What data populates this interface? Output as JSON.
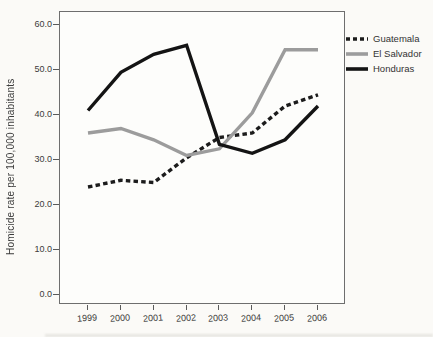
{
  "chart_data": {
    "type": "line",
    "x": [
      1999,
      2000,
      2001,
      2002,
      2003,
      2004,
      2005,
      2006
    ],
    "xtick_labels": [
      "1999",
      "2000",
      "2001",
      "2002",
      "2003",
      "2004",
      "2005",
      "2006"
    ],
    "series": [
      {
        "name": "Guatemala",
        "values": [
          24,
          25.5,
          25,
          30.5,
          35,
          36,
          42,
          44.5
        ],
        "color": "#1c1c1c",
        "line_style": "dashed"
      },
      {
        "name": "El Salvador",
        "values": [
          36,
          37,
          34.5,
          31,
          32.5,
          40.5,
          54.5,
          54.5
        ],
        "color": "#9c9c9c",
        "line_style": "solid"
      },
      {
        "name": "Honduras",
        "values": [
          41,
          49.5,
          53.5,
          55.5,
          33.5,
          31.5,
          34.5,
          42
        ],
        "color": "#141414",
        "line_style": "solid"
      }
    ],
    "title": "",
    "xlabel": "",
    "ylabel": "Homicide rate per 100,000 inhabitants",
    "yticks": [
      0,
      10,
      20,
      30,
      40,
      50,
      60
    ],
    "ytick_labels": [
      "0.0",
      "10.0",
      "20.0",
      "30.0",
      "40.0",
      "50.0",
      "60.0"
    ],
    "ylim": [
      -2,
      63
    ],
    "grid": false,
    "legend_position": "right"
  }
}
